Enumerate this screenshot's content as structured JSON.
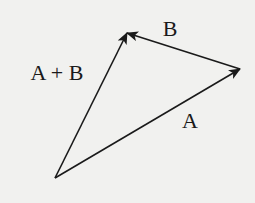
{
  "diagram": {
    "colors": {
      "background": "#f1f1ef",
      "stroke": "#1a1a1a"
    },
    "points": {
      "origin": [
        55,
        178
      ],
      "a_tip": [
        240,
        69
      ],
      "sum_tip": [
        127,
        33
      ]
    },
    "vectors": [
      {
        "id": "A",
        "label": "A",
        "from": [
          55,
          178
        ],
        "to": [
          240,
          69
        ],
        "label_pos": [
          190,
          128
        ]
      },
      {
        "id": "B",
        "label": "B",
        "from": [
          240,
          69
        ],
        "to": [
          127,
          33
        ],
        "label_pos": [
          170,
          36
        ]
      },
      {
        "id": "A_plus_B",
        "label": "A + B",
        "from": [
          55,
          178
        ],
        "to": [
          127,
          33
        ],
        "label_pos": [
          57,
          80
        ]
      }
    ]
  }
}
